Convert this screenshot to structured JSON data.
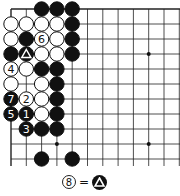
{
  "board": {
    "origin": [
      11,
      9
    ],
    "spacing": [
      15.3,
      15
    ],
    "cols": 12,
    "rows": 11,
    "edges": {
      "top": true,
      "left": true,
      "right": false,
      "bottom": false
    },
    "star_points": [
      [
        3,
        9
      ],
      [
        9,
        3
      ],
      [
        9,
        9
      ]
    ],
    "stones": [
      {
        "c": 2,
        "r": 0,
        "color": "black"
      },
      {
        "c": 3,
        "r": 0,
        "color": "black"
      },
      {
        "c": 4,
        "r": 0,
        "color": "black"
      },
      {
        "c": 0,
        "r": 1,
        "color": "white"
      },
      {
        "c": 1,
        "r": 1,
        "color": "white"
      },
      {
        "c": 2,
        "r": 1,
        "color": "white"
      },
      {
        "c": 3,
        "r": 1,
        "color": "white"
      },
      {
        "c": 4,
        "r": 1,
        "color": "black"
      },
      {
        "c": 0,
        "r": 2,
        "color": "white"
      },
      {
        "c": 1,
        "r": 2,
        "color": "black"
      },
      {
        "c": 2,
        "r": 2,
        "color": "white",
        "label": "6"
      },
      {
        "c": 3,
        "r": 2,
        "color": "white"
      },
      {
        "c": 4,
        "r": 2,
        "color": "black"
      },
      {
        "c": 0,
        "r": 3,
        "color": "black"
      },
      {
        "c": 1,
        "r": 3,
        "color": "black",
        "mark": "triangle"
      },
      {
        "c": 2,
        "r": 3,
        "color": "white"
      },
      {
        "c": 3,
        "r": 3,
        "color": "white"
      },
      {
        "c": 4,
        "r": 3,
        "color": "black"
      },
      {
        "c": 0,
        "r": 4,
        "color": "white",
        "label": "4"
      },
      {
        "c": 1,
        "r": 4,
        "color": "white"
      },
      {
        "c": 2,
        "r": 4,
        "color": "black"
      },
      {
        "c": 3,
        "r": 4,
        "color": "black"
      },
      {
        "c": 0,
        "r": 5,
        "color": "white"
      },
      {
        "c": 2,
        "r": 5,
        "color": "white"
      },
      {
        "c": 3,
        "r": 5,
        "color": "black"
      },
      {
        "c": 0,
        "r": 6,
        "color": "black",
        "label": "7"
      },
      {
        "c": 1,
        "r": 6,
        "color": "white",
        "label": "2"
      },
      {
        "c": 2,
        "r": 6,
        "color": "white"
      },
      {
        "c": 3,
        "r": 6,
        "color": "black"
      },
      {
        "c": 0,
        "r": 7,
        "color": "black",
        "label": "5"
      },
      {
        "c": 1,
        "r": 7,
        "color": "black",
        "label": "1"
      },
      {
        "c": 2,
        "r": 7,
        "color": "white"
      },
      {
        "c": 3,
        "r": 7,
        "color": "black"
      },
      {
        "c": 1,
        "r": 8,
        "color": "black",
        "label": "3"
      },
      {
        "c": 2,
        "r": 8,
        "color": "black"
      },
      {
        "c": 3,
        "r": 8,
        "color": "black"
      },
      {
        "c": 2,
        "r": 10,
        "color": "black"
      },
      {
        "c": 4,
        "r": 10,
        "color": "black"
      }
    ]
  },
  "legend": {
    "move": "8",
    "equals": "=",
    "target": "triangle-black-stone"
  }
}
